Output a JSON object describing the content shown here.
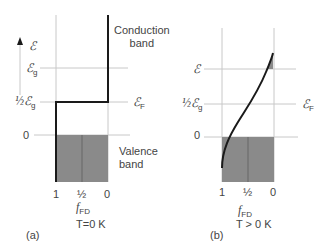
{
  "panel_a": {
    "caption": "(a)",
    "temperature_label": "T=0 K",
    "energy_axis_label": "ℰ",
    "level_labels": {
      "eg": "ℰ",
      "eg_sub": "g",
      "half_eg_prefix": "½ℰ",
      "half_eg_sub": "g",
      "zero": "0",
      "ef": "ℰ",
      "ef_sub": "F"
    },
    "conduction_band_label": [
      "Conduction",
      "band"
    ],
    "valence_band_label": [
      "Valence",
      "band"
    ],
    "x_ticks": [
      "1",
      "½",
      "0"
    ],
    "x_axis_label": "f",
    "x_axis_sub": "FD"
  },
  "panel_b": {
    "caption": "(b)",
    "temperature_label": "T > 0 K",
    "level_labels": {
      "e": "ℰ",
      "half_eg_prefix": "½ℰ",
      "half_eg_sub": "g",
      "zero": "0",
      "ef": "ℰ",
      "ef_sub": "F"
    },
    "x_ticks": [
      "1",
      "½",
      "0"
    ],
    "x_axis_label": "f",
    "x_axis_sub": "FD"
  },
  "colors": {
    "shade": "#8a8a8a",
    "curve": "#1a1a1a",
    "grid": "#c8c8c8"
  }
}
